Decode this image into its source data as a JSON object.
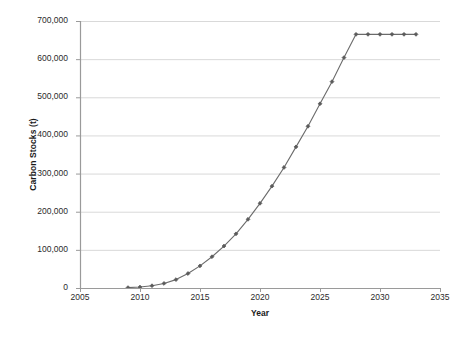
{
  "chart_data": {
    "type": "line",
    "title": "",
    "xlabel": "Year",
    "ylabel": "Carbon Stocks (t)",
    "xlim": [
      2005,
      2035
    ],
    "ylim": [
      0,
      700000
    ],
    "xticks": [
      2005,
      2010,
      2015,
      2020,
      2025,
      2030,
      2035
    ],
    "xtick_labels": [
      "2005",
      "2010",
      "2015",
      "2020",
      "2025",
      "2030",
      "2035"
    ],
    "yticks": [
      0,
      100000,
      200000,
      300000,
      400000,
      500000,
      600000,
      700000
    ],
    "ytick_labels": [
      "0",
      "100,000",
      "200,000",
      "300,000",
      "400,000",
      "500,000",
      "600,000",
      "700,000"
    ],
    "grid": "horizontal",
    "legend": "none",
    "series": [
      {
        "name": "Carbon Stocks",
        "color": "#6b6b6b",
        "marker": "diamond",
        "x": [
          2009,
          2010,
          2011,
          2012,
          2013,
          2014,
          2015,
          2016,
          2017,
          2018,
          2019,
          2020,
          2021,
          2022,
          2023,
          2024,
          2025,
          2026,
          2027,
          2028,
          2029,
          2030,
          2031,
          2032,
          2033
        ],
        "values": [
          1000,
          2500,
          6000,
          12000,
          22000,
          38000,
          58000,
          82000,
          110000,
          142000,
          180000,
          222000,
          267000,
          316000,
          370000,
          424000,
          483000,
          541000,
          604000,
          665000,
          665000,
          665000,
          665000,
          665000,
          665000
        ]
      }
    ]
  },
  "style": {
    "line_color": "#6b6b6b",
    "marker_color": "#5a5a5a",
    "grid_color": "#d9d9d9",
    "axis_color": "#9a9a9a",
    "text_color": "#2b2b2b",
    "background": "#ffffff"
  }
}
